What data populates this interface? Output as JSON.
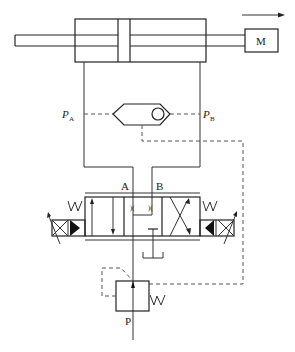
{
  "diagram": {
    "type": "hydraulic-circuit",
    "labels": {
      "load": "M",
      "port_a": "A",
      "port_b": "B",
      "pressure_a": "P",
      "pressure_a_sub": "A",
      "pressure_b": "P",
      "pressure_b_sub": "B",
      "pump_port": "P"
    },
    "components": [
      {
        "id": "cylinder",
        "name": "double-rod hydraulic cylinder"
      },
      {
        "id": "load",
        "name": "load mass M"
      },
      {
        "id": "motion-arrow",
        "name": "direction of motion arrow (right)"
      },
      {
        "id": "shuttle-valve",
        "name": "shuttle valve (OR valve) with ball"
      },
      {
        "id": "directional-valve",
        "name": "4/3 proportional directional valve with solenoids and springs"
      },
      {
        "id": "pressure-compensator",
        "name": "pressure compensator valve with spring"
      },
      {
        "id": "tank",
        "name": "tank T"
      }
    ],
    "colors": {
      "line": "#333333",
      "background": "#ffffff"
    }
  }
}
